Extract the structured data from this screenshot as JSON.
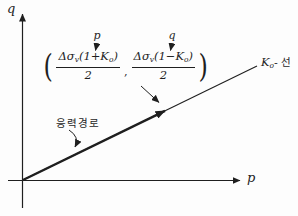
{
  "diagram": {
    "title_semantic": "K0 stress path p-q diagram",
    "axes": {
      "x_label": "p",
      "y_label": "q"
    },
    "k0_line_label": {
      "k": "K",
      "sub": "o",
      "suffix": "- 선"
    },
    "stress_path_label": "응력경로",
    "point_annotation": {
      "open_paren": "(",
      "close_paren": ")",
      "comma": ",",
      "p_pointer": "p",
      "q_pointer": "q",
      "frac1": {
        "pre": "Δσ",
        "sub_v": "v",
        "mid": "(1+",
        "k": "K",
        "sub_k": "o",
        "post": ")",
        "den": "2"
      },
      "frac2": {
        "pre": "Δσ",
        "sub_v": "v",
        "mid": "(1−",
        "k": "K",
        "sub_k": "o",
        "post": ")",
        "den": "2"
      }
    },
    "colors": {
      "ink": "#1f1f1f",
      "background": "#fdfdfd"
    }
  }
}
